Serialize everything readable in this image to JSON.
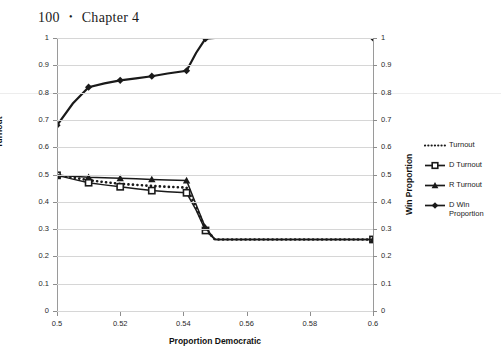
{
  "page_header": {
    "page_number": "100",
    "separator": "•",
    "chapter": "Chapter 4"
  },
  "chart_data": {
    "type": "line",
    "title": "",
    "xlabel": "Proportion Democratic",
    "ylabel": "Turnout",
    "y2label": "Win Proportion",
    "xlim": [
      0.5,
      0.6
    ],
    "ylim": [
      0,
      1
    ],
    "y2lim": [
      0,
      1
    ],
    "grid": true,
    "legend_position": "right",
    "xticks": [
      "0.5",
      "0.52",
      "0.54",
      "0.56",
      "0.58",
      "0.6"
    ],
    "xtick_values": [
      0.5,
      0.52,
      0.54,
      0.56,
      0.58,
      0.6
    ],
    "yticks": [
      "0",
      "0.1",
      "0.2",
      "0.3",
      "0.4",
      "0.5",
      "0.6",
      "0.7",
      "0.8",
      "0.9",
      "1"
    ],
    "ytick_values": [
      0,
      0.1,
      0.2,
      0.3,
      0.4,
      0.5,
      0.6,
      0.7,
      0.8,
      0.9,
      1
    ],
    "y2ticks": [
      "0",
      "0.1",
      "0.2",
      "0.3",
      "0.4",
      "0.5",
      "0.6",
      "0.7",
      "0.8",
      "0.9",
      "1"
    ],
    "y2tick_values": [
      0,
      0.1,
      0.2,
      0.3,
      0.4,
      0.5,
      0.6,
      0.7,
      0.8,
      0.9,
      1
    ],
    "x": [
      0.5,
      0.505,
      0.51,
      0.515,
      0.52,
      0.525,
      0.53,
      0.535,
      0.541,
      0.544,
      0.547,
      0.55,
      0.555,
      0.56,
      0.565,
      0.57,
      0.575,
      0.58,
      0.585,
      0.59,
      0.595,
      0.6
    ],
    "series": [
      {
        "name": "Turnout",
        "axis": "left",
        "style": "dotted",
        "marker": "none",
        "color": "#1a1a1a",
        "values": [
          0.497,
          0.489,
          0.479,
          0.472,
          0.466,
          0.462,
          0.458,
          0.455,
          0.452,
          0.38,
          0.3,
          0.262,
          0.262,
          0.262,
          0.262,
          0.262,
          0.262,
          0.262,
          0.262,
          0.262,
          0.262,
          0.262
        ]
      },
      {
        "name": "D Turnout",
        "axis": "left",
        "style": "solid",
        "marker": "square",
        "color": "#1a1a1a",
        "values": [
          0.497,
          0.483,
          0.47,
          0.462,
          0.455,
          0.448,
          0.441,
          0.437,
          0.433,
          0.37,
          0.295,
          0.262,
          0.262,
          0.262,
          0.262,
          0.262,
          0.262,
          0.262,
          0.262,
          0.262,
          0.262,
          0.262
        ]
      },
      {
        "name": "R Turnout",
        "axis": "left",
        "style": "solid",
        "marker": "triangle",
        "color": "#1a1a1a",
        "values": [
          0.497,
          0.494,
          0.49,
          0.488,
          0.486,
          0.484,
          0.482,
          0.48,
          0.478,
          0.39,
          0.305,
          0.262,
          0.262,
          0.262,
          0.262,
          0.262,
          0.262,
          0.262,
          0.262,
          0.262,
          0.262,
          0.262
        ]
      },
      {
        "name": "D Win Proportion",
        "axis": "right",
        "style": "solid",
        "marker": "diamond",
        "color": "#1a1a1a",
        "values": [
          0.68,
          0.76,
          0.82,
          0.834,
          0.845,
          0.852,
          0.86,
          0.87,
          0.88,
          0.945,
          0.998,
          1.0,
          1.0,
          1.0,
          1.0,
          1.0,
          1.0,
          1.0,
          1.0,
          1.0,
          1.0,
          1.0
        ]
      }
    ],
    "marker_x": [
      0.5,
      0.51,
      0.52,
      0.53,
      0.541,
      0.547,
      0.6
    ],
    "legend": [
      {
        "label": "Turnout",
        "style": "dotted",
        "marker": "none"
      },
      {
        "label": "D Turnout",
        "style": "solid",
        "marker": "square"
      },
      {
        "label": "R Turnout",
        "style": "solid",
        "marker": "triangle"
      },
      {
        "label": "D Win Proportion",
        "style": "solid",
        "marker": "diamond"
      }
    ]
  }
}
